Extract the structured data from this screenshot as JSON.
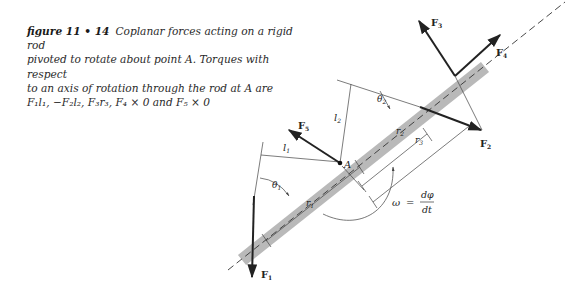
{
  "caption": {
    "figure_label": "figure 11 • 14",
    "line1": "Coplanar forces acting on a rigid rod",
    "line2": "pivoted to rotate about point A. Torques with respect",
    "line3": "to an axis of rotation through the rod at A are",
    "line4": "F₁l₁, −F₂l₂, F₃r₃, F₄ × 0 and F₅ × 0"
  },
  "diagram": {
    "pivot_label": "A",
    "forces": {
      "F1": {
        "main": "F",
        "sub": "1"
      },
      "F2": {
        "main": "F",
        "sub": "2"
      },
      "F3": {
        "main": "F",
        "sub": "3"
      },
      "F4": {
        "main": "F",
        "sub": "4"
      },
      "F5": {
        "main": "F",
        "sub": "5"
      }
    },
    "lever_arms": {
      "l1": {
        "main": "l",
        "sub": "1"
      },
      "l2": {
        "main": "l",
        "sub": "2"
      }
    },
    "distances": {
      "r1": {
        "main": "r",
        "sub": "1"
      },
      "r2": {
        "main": "r",
        "sub": "2"
      },
      "r3": {
        "main": "r",
        "sub": "3"
      }
    },
    "angles": {
      "theta1": {
        "main": "θ",
        "sub": "1"
      },
      "theta2": {
        "main": "θ",
        "sub": "2"
      }
    },
    "omega_equation": {
      "lhs": "ω",
      "eq": "=",
      "numerator": "dφ",
      "denominator": "dt"
    }
  }
}
